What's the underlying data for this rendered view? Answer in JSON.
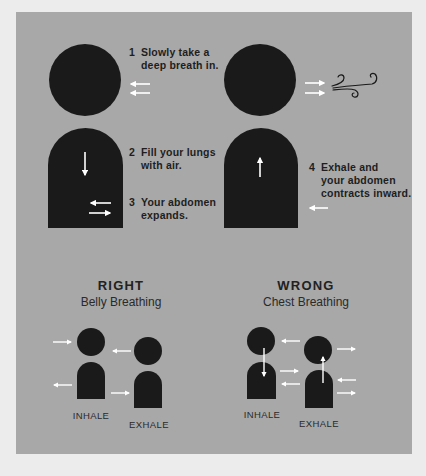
{
  "colors": {
    "page_bg": "#ececec",
    "panel_bg": "#a8a8a8",
    "figure": "#1a1a1a",
    "arrow": "#ffffff",
    "text": "#1e1e1e"
  },
  "steps": [
    {
      "number": "1",
      "text": "Slowly take a\ndeep breath in."
    },
    {
      "number": "2",
      "text": "Fill your lungs\nwith air."
    },
    {
      "number": "3",
      "text": "Your abdomen\nexpands."
    },
    {
      "number": "4",
      "text": "Exhale and\nyour abdomen\ncontracts inward."
    }
  ],
  "icons": {
    "wind": "wind-swirl-icon",
    "arrow": "arrow-icon"
  },
  "comparison": {
    "right": {
      "title": "RIGHT",
      "subtitle": "Belly Breathing",
      "inhale_label": "INHALE",
      "exhale_label": "EXHALE"
    },
    "wrong": {
      "title": "WRONG",
      "subtitle": "Chest Breathing",
      "inhale_label": "INHALE",
      "exhale_label": "EXHALE"
    }
  }
}
